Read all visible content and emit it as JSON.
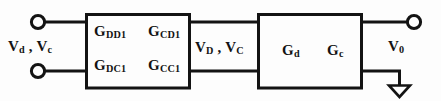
{
  "figure": {
    "type": "two-port-block-diagram",
    "background_color": "#fdfdfd",
    "line_color": "#131313",
    "text_color": "#131313"
  },
  "ports": {
    "input_label": "Vd , Vc",
    "input_label_parts": {
      "v1": "V",
      "s1": "d",
      "sep": " , ",
      "v2": "V",
      "s2": "c"
    },
    "interstage_label_parts": {
      "v1": "V",
      "s1": "D",
      "sep": " , ",
      "v2": "V",
      "s2": "C"
    },
    "output_label_parts": {
      "v": "V",
      "s": "0"
    }
  },
  "blocks": [
    {
      "name": "stage-1",
      "labels": [
        {
          "base": "G",
          "sub": "DD1"
        },
        {
          "base": "G",
          "sub": "CD1"
        },
        {
          "base": "G",
          "sub": "DC1"
        },
        {
          "base": "G",
          "sub": "CC1"
        }
      ]
    },
    {
      "name": "stage-2",
      "labels": [
        {
          "base": "G",
          "sub": "d"
        },
        {
          "base": "G",
          "sub": "c"
        }
      ]
    }
  ],
  "symbols": {
    "input_terminal_top": "terminal-circle",
    "input_terminal_bottom": "terminal-circle",
    "output_terminal": "terminal-circle",
    "ground": "ground-triangle-symbol"
  }
}
